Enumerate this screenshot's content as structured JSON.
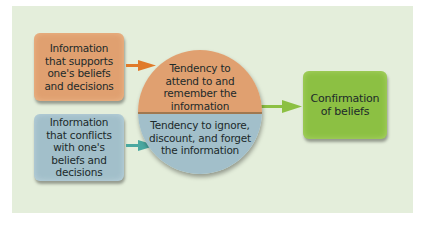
{
  "diagram": {
    "nodes": {
      "supports": {
        "label": "Information that supports one's beliefs and decisions",
        "color": "#e0a070"
      },
      "conflicts": {
        "label": "Information that conflicts with one's beliefs and decisions",
        "color": "#a2bfca"
      },
      "attend": {
        "label": "Tendency to attend to and remember the information",
        "color": "#e0a070"
      },
      "ignore": {
        "label": "Tendency to ignore, discount, and forget the information",
        "color": "#a2bfca"
      },
      "confirmation": {
        "label": "Confirmation of beliefs",
        "color": "#8cc043"
      }
    },
    "edges": [
      {
        "from": "supports",
        "to": "attend",
        "color": "#e07a2a"
      },
      {
        "from": "conflicts",
        "to": "ignore",
        "color": "#4aa8a0"
      },
      {
        "from": "circle",
        "to": "confirmation",
        "color": "#8cc043"
      }
    ],
    "background_color": "#e4eedb"
  }
}
